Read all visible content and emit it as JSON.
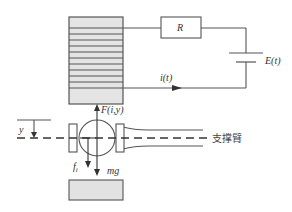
{
  "diagram": {
    "type": "maglev-levitation-circuit",
    "labels": {
      "resistor": "R",
      "source": "E(t)",
      "current": "i(t)",
      "force": "F(i,y)",
      "displacement": "y",
      "friction": "f",
      "friction_sub": "i",
      "gravity": "mg",
      "arm": "支撑臂"
    },
    "colors": {
      "stroke": "#555555",
      "coil_fill": "#e4e4e4",
      "block_fill": "#e2e2e2",
      "text": "#333333"
    },
    "coil_winding_count": 11
  }
}
